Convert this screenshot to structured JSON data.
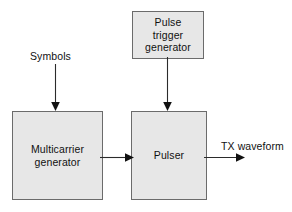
{
  "diagram": {
    "colors": {
      "block_fill": "#e7e7e7",
      "block_border": "#6b6b6b",
      "arrow": "#2b2b2b",
      "text": "#111111",
      "background": "#ffffff"
    },
    "blocks": [
      {
        "id": "pulse-trigger-generator",
        "label": "Pulse\ntrigger\ngenerator",
        "x": 132,
        "y": 11,
        "width": 72,
        "height": 48
      },
      {
        "id": "multicarrier-generator",
        "label": "Multicarrier\ngenerator",
        "x": 12,
        "y": 111,
        "width": 91,
        "height": 89
      },
      {
        "id": "pulser",
        "label": "Pulser",
        "x": 131,
        "y": 111,
        "width": 76,
        "height": 89
      }
    ],
    "labels": [
      {
        "id": "symbols",
        "text": "Symbols",
        "x": 30,
        "y": 50
      },
      {
        "id": "tx-waveform",
        "text": "TX waveform",
        "x": 221,
        "y": 140
      }
    ],
    "connectors": [
      {
        "id": "symbols-to-multicarrier",
        "from": "Symbols",
        "to": "Multicarrier generator",
        "direction": "down",
        "arrowhead": "end"
      },
      {
        "id": "trigger-to-pulser",
        "from": "Pulse trigger generator",
        "to": "Pulser",
        "direction": "down",
        "arrowhead": "end"
      },
      {
        "id": "multicarrier-to-pulser",
        "from": "Multicarrier generator",
        "to": "Pulser",
        "direction": "right",
        "arrowhead": "end"
      },
      {
        "id": "pulser-to-output",
        "from": "Pulser",
        "to": "TX waveform",
        "direction": "right",
        "arrowhead": "end"
      }
    ]
  }
}
